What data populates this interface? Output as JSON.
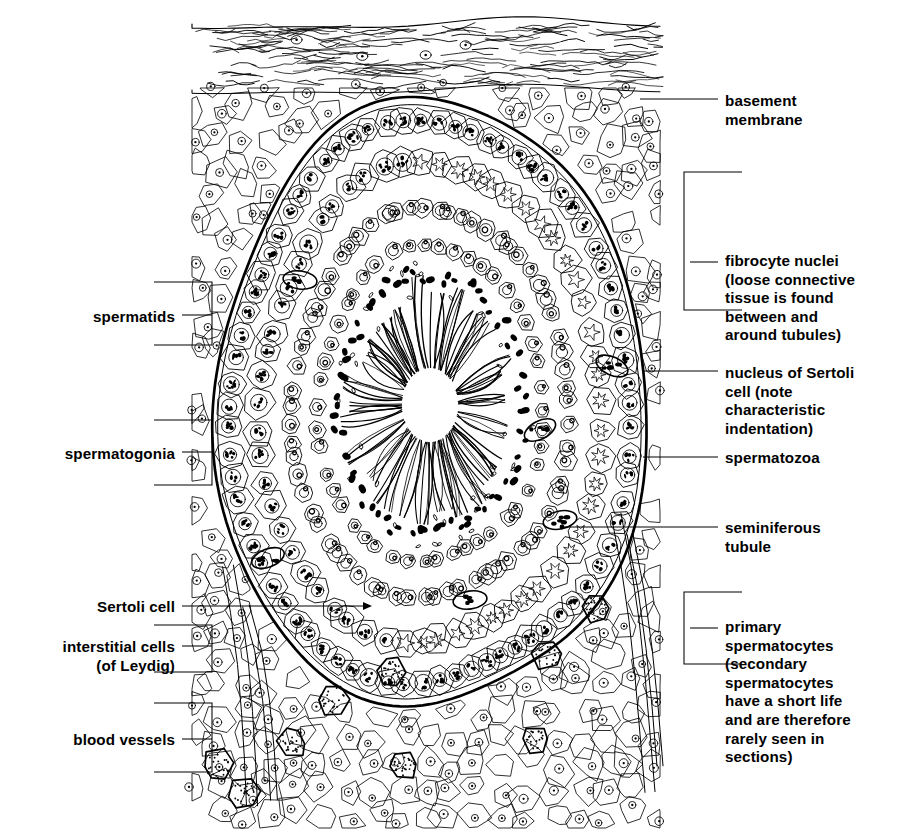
{
  "figure": {
    "ink_color": "#000000",
    "background_color": "#ffffff",
    "width": 900,
    "height": 837
  },
  "labels": {
    "basement_membrane": {
      "lines": [
        "basement",
        "membrane"
      ],
      "side": "right",
      "text_x": 725,
      "text_y": 106,
      "leader": {
        "x1": 640,
        "y1": 99,
        "x2": 718,
        "y2": 99
      },
      "bracket": null
    },
    "fibrocyte_nuclei": {
      "lines": [
        "fibrocyte nuclei",
        "(loose connective",
        "tissue is found",
        "between and",
        "around tubules)"
      ],
      "side": "right",
      "text_x": 725,
      "text_y": 266,
      "leader": {
        "x1": 690,
        "y1": 262,
        "x2": 718,
        "y2": 262
      },
      "bracket": {
        "x": 684,
        "y_top": 172,
        "y_bottom": 310,
        "depth": 58,
        "open": "left"
      }
    },
    "nucleus_of_sertoli_cell": {
      "lines": [
        "nucleus of Sertoli",
        "cell (note",
        "characteristic",
        "indentation)"
      ],
      "side": "right",
      "text_x": 725,
      "text_y": 378,
      "leader": {
        "x1": 643,
        "y1": 371,
        "x2": 718,
        "y2": 371
      },
      "bracket": null
    },
    "spermatozoa": {
      "lines": [
        "spermatozoa"
      ],
      "side": "right",
      "text_x": 725,
      "text_y": 463,
      "leader": {
        "x1": 643,
        "y1": 457,
        "x2": 718,
        "y2": 457
      },
      "bracket": null
    },
    "seminiferous_tubule": {
      "lines": [
        "seminiferous",
        "tubule"
      ],
      "side": "right",
      "text_x": 725,
      "text_y": 533,
      "leader": {
        "x1": 562,
        "y1": 527,
        "x2": 718,
        "y2": 527
      },
      "dot": {
        "cx": 562,
        "cy": 527,
        "r": 2.4
      },
      "bracket": null
    },
    "primary_spermatocytes": {
      "lines": [
        "primary",
        "spermatocytes",
        "(secondary",
        "spermatocytes",
        "have a short life",
        "and are therefore",
        "rarely seen in",
        "sections)"
      ],
      "side": "right",
      "text_x": 725,
      "text_y": 632,
      "leader": {
        "x1": 690,
        "y1": 628,
        "x2": 718,
        "y2": 628
      },
      "bracket": {
        "x": 684,
        "y_top": 592,
        "y_bottom": 664,
        "depth": 58,
        "open": "left"
      }
    },
    "spermatids": {
      "lines": [
        "spermatids"
      ],
      "side": "left",
      "text_x": 175,
      "text_y": 322,
      "leader": {
        "x1": 182,
        "y1": 315,
        "x2": 212,
        "y2": 315
      },
      "bracket": {
        "x": 212,
        "y_top": 282,
        "y_bottom": 345,
        "depth": 58,
        "open": "right"
      }
    },
    "spermatogonia": {
      "lines": [
        "spermatogonia"
      ],
      "side": "left",
      "text_x": 175,
      "text_y": 459,
      "leader": {
        "x1": 182,
        "y1": 452,
        "x2": 212,
        "y2": 452
      },
      "bracket": {
        "x": 212,
        "y_top": 420,
        "y_bottom": 485,
        "depth": 58,
        "open": "right"
      }
    },
    "sertoli_cell": {
      "lines": [
        "Sertoli cell"
      ],
      "side": "left",
      "text_x": 175,
      "text_y": 612,
      "leader": {
        "x1": 182,
        "y1": 606,
        "x2": 366,
        "y2": 606
      },
      "arrow": {
        "x": 372,
        "y": 606
      },
      "bracket": null
    },
    "interstitial_cells": {
      "lines": [
        "interstitial cells",
        "(of Leydig)"
      ],
      "side": "left",
      "text_x": 175,
      "text_y": 652,
      "leader": {
        "x1": 182,
        "y1": 646,
        "x2": 212,
        "y2": 646
      },
      "bracket": {
        "x": 212,
        "y_top": 625,
        "y_bottom": 672,
        "depth": 58,
        "open": "right"
      }
    },
    "blood_vessels": {
      "lines": [
        "blood vessels"
      ],
      "side": "left",
      "text_x": 175,
      "text_y": 745,
      "leader": {
        "x1": 182,
        "y1": 739,
        "x2": 212,
        "y2": 739
      },
      "bracket": {
        "x": 212,
        "y_top": 703,
        "y_bottom": 772,
        "depth": 58,
        "open": "right"
      }
    }
  },
  "structures": {
    "tunica_albuginea": {
      "name": "fibrous capsule with wavy collagen fibres",
      "region": {
        "x": 192,
        "y": 22,
        "w": 468,
        "h": 72
      },
      "fibre_count": 150
    },
    "interstitial_tissue": {
      "name": "loose connective tissue polygonal cells surrounding tubule",
      "cell_count": 330
    },
    "tubule": {
      "name": "seminiferous tubule",
      "outline_cx": 430,
      "outline_cy": 405,
      "outline_rx": 215,
      "outline_ry": 305,
      "wall_stroke_width": 2.6
    },
    "lumen": {
      "name": "lumen with radiating spermatozoa tails",
      "cx": 430,
      "cy": 390,
      "rx": 95,
      "ry": 125,
      "tail_tuft_count": 26
    },
    "germ_layers": [
      {
        "name": "spermatogonia",
        "ring": 0.97,
        "cell_r": 13,
        "nucleus": "speckled"
      },
      {
        "name": "primary-spermatocytes",
        "ring": 0.8,
        "cell_r": 14,
        "nucleus": "star"
      },
      {
        "name": "spermatids",
        "ring": 0.6,
        "cell_r": 9,
        "nucleus": "ring"
      },
      {
        "name": "spermatozoa",
        "ring": 0.43,
        "cell_r": 5,
        "nucleus": "dark"
      }
    ],
    "leydig_cells": {
      "name": "interstitial cells of Leydig",
      "count": 9,
      "fill": "stippled"
    },
    "blood_vessels": {
      "name": "blood vessels in interstitium",
      "count": 2
    }
  }
}
